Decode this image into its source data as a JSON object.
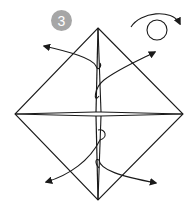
{
  "diagram": {
    "type": "origami-instruction-step",
    "step": {
      "number": "3",
      "badge_color": "#a6a6a6",
      "text_color": "#ffffff"
    },
    "symbols": [
      {
        "name": "turn-over",
        "description": "circular arrow indicating turn the model over"
      }
    ],
    "shape": "square base (diamond) with horizontal and vertical folded flaps",
    "arrows": [
      {
        "direction": "up-left",
        "from": "center-top",
        "note": "pull flap out"
      },
      {
        "direction": "up-right",
        "from": "center",
        "note": "pull flap out"
      },
      {
        "direction": "down-left",
        "from": "center",
        "note": "pull flap out"
      },
      {
        "direction": "down-right",
        "from": "center-bottom",
        "note": "pull flap out"
      }
    ],
    "colors": {
      "line": "#1a1a1a",
      "background": "#ffffff"
    }
  }
}
